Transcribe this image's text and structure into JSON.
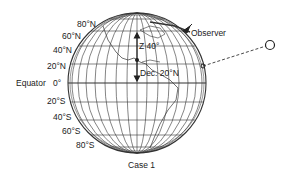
{
  "diagram": {
    "caption": "Case 1",
    "latitude_labels": {
      "n80": "80°N",
      "n60": "60°N",
      "n40": "40°N",
      "n20": "20°N",
      "eq": "0°",
      "s20": "20°S",
      "s40": "40°S",
      "s60": "60°S",
      "s80": "80°S"
    },
    "equator_label": "Equator",
    "observer_label": "Observer",
    "zenith_label": "Z 40°",
    "declination_label": "Dec. 20°N",
    "celestial_body": "sun-circle",
    "colors": {
      "line": "#333333",
      "background": "#ffffff"
    }
  }
}
